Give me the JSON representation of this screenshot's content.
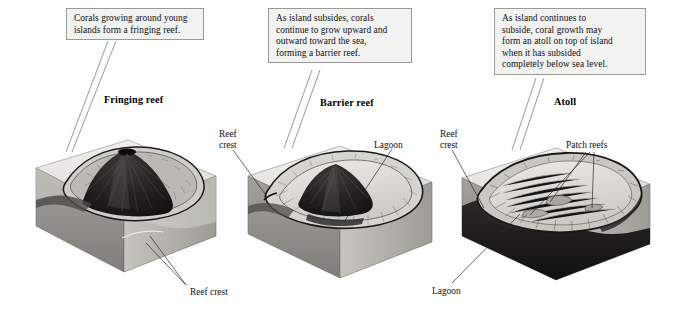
{
  "figure": {
    "kind": "coral-reef-formation-diagram",
    "background": "#ffffff"
  },
  "callouts": [
    {
      "id": "fringing",
      "lines": [
        "Corals growing around young",
        "islands form a fringing reef."
      ]
    },
    {
      "id": "barrier",
      "lines": [
        "As island subsides, corals",
        "continue to grow upward and",
        "outward toward the sea,",
        "forming a barrier reef."
      ]
    },
    {
      "id": "atoll",
      "lines": [
        "As island continues to",
        "subside, coral growth may",
        "form an atoll on top of island",
        "when it has subsided",
        "completely below sea level."
      ]
    }
  ],
  "stages": [
    {
      "id": "stage-1",
      "title": "Fringing reef"
    },
    {
      "id": "stage-2",
      "title": "Barrier reef"
    },
    {
      "id": "stage-3",
      "title": "Atoll"
    }
  ],
  "labels": {
    "reef_crest_1": "Reef crest",
    "reef_crest_2_line1": "Reef",
    "reef_crest_2_line2": "crest",
    "lagoon_2": "Lagoon",
    "reef_crest_3_line1": "Reef",
    "reef_crest_3_line2": "crest",
    "lagoon_3": "Lagoon",
    "patch_reefs": "Patch reefs"
  },
  "colors": {
    "callout_fill": "#f2f2f0",
    "callout_border": "#9a9a9a",
    "leader_line": "#2a2a2a",
    "tail_line": "#6f6f6f",
    "block_top": "#e9e8e4",
    "block_front": "#8e8d89",
    "block_side": "#b9b8b3",
    "island_dark": "#1f1e1c",
    "lagoon_light": "#dcdbd6",
    "reef_ring": "#3a3936"
  }
}
